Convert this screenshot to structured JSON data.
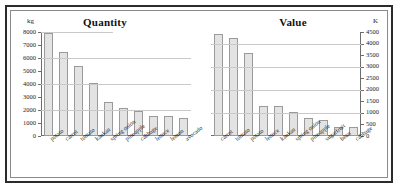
{
  "chart_data": [
    {
      "type": "bar",
      "title": "Quantity",
      "xlabel": "",
      "ylabel": "kg",
      "unit_label": "kg",
      "unit_position": "top-left",
      "ylim": [
        0,
        8000
      ],
      "ytick_step": 1000,
      "gridline_step": 2000,
      "grid": true,
      "legend": "none",
      "categories": [
        "potato",
        "carrot",
        "tomato",
        "kaukau",
        "spring onion",
        "pineapple",
        "cabbage",
        "lettuce",
        "lemon",
        "avocado"
      ],
      "values": [
        7900,
        6500,
        5400,
        4100,
        2600,
        2150,
        1900,
        1550,
        1550,
        1400
      ],
      "yticks": [
        0,
        1000,
        2000,
        3000,
        4000,
        5000,
        6000,
        7000,
        8000
      ],
      "ytick_labels": [
        "0",
        "1000",
        "2000",
        "3000",
        "4000",
        "5000",
        "6000",
        "7000",
        "8000"
      ],
      "gridlines": [
        2000,
        4000,
        6000,
        8000
      ],
      "bar_fill": "#e3e3e3",
      "bar_stroke": "#9a9a9a"
    },
    {
      "type": "bar",
      "title": "Value",
      "xlabel": "",
      "ylabel": "K",
      "unit_label": "K",
      "unit_position": "top-right",
      "ylim": [
        0,
        4500
      ],
      "ytick_step": 500,
      "gridline_step": 1000,
      "grid": true,
      "legend": "none",
      "axis_side": "right",
      "categories": [
        "carrot",
        "tomato",
        "potato",
        "lettuce",
        "kaukau",
        "spring onion",
        "pineapple",
        "sugarfruit",
        "bean",
        "cabbage"
      ],
      "values": [
        4400,
        4250,
        3600,
        1300,
        1300,
        1050,
        800,
        700,
        400,
        380
      ],
      "yticks": [
        0,
        500,
        1000,
        1500,
        2000,
        2500,
        3000,
        3500,
        4000,
        4500
      ],
      "ytick_labels": [
        "0",
        "500",
        "1000",
        "1500",
        "2000",
        "2500",
        "3000",
        "3500",
        "4000",
        "4500"
      ],
      "gridlines": [
        1000,
        2000,
        3000,
        4000
      ],
      "bar_fill": "#e3e3e3",
      "bar_stroke": "#9a9a9a"
    }
  ],
  "colors": {
    "frame": "#2b2b2b",
    "inner_border": "#8a8a8a",
    "grid": "#c9c9c9",
    "axis": "#6d6d6d",
    "text": "#1c1c1c",
    "background": "#ffffff"
  }
}
